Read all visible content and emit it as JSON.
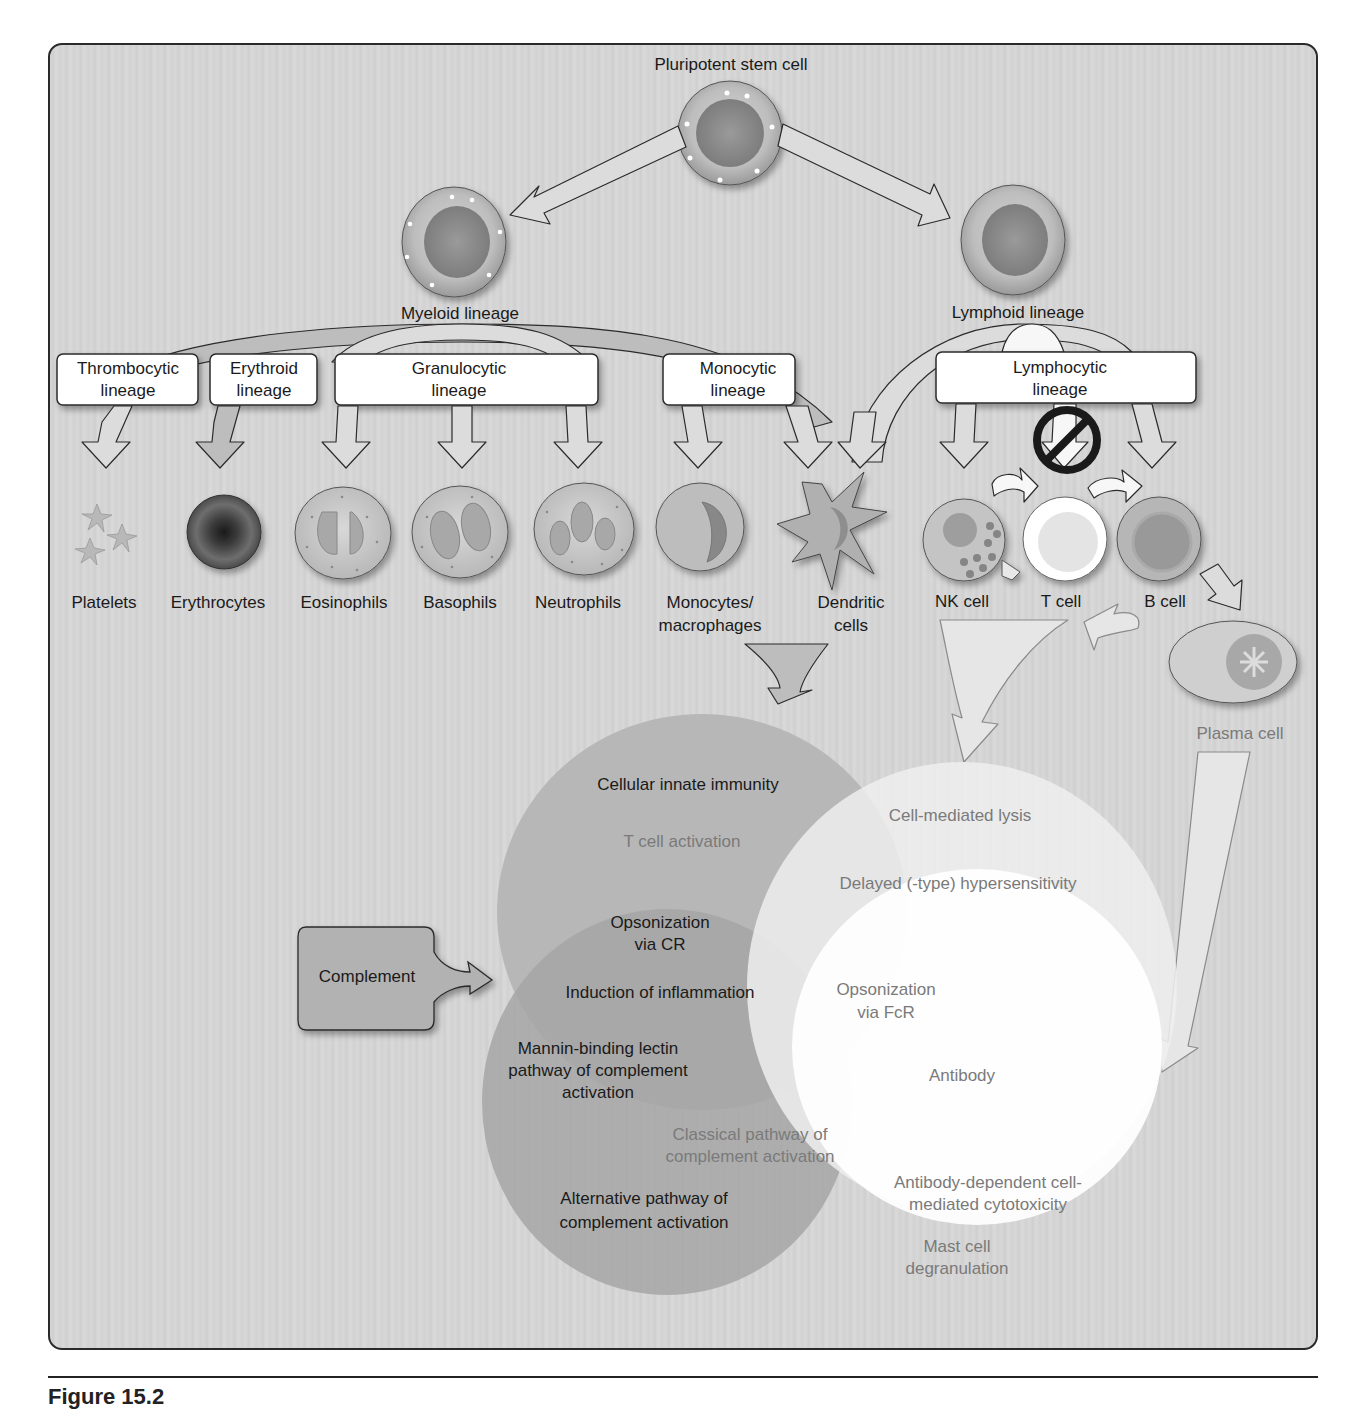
{
  "figure": {
    "caption": "Figure 15.2",
    "stem_cell": {
      "label": "Pluripotent stem cell"
    },
    "progenitors": [
      {
        "id": "myeloid",
        "label": "Myeloid lineage"
      },
      {
        "id": "lymphoid",
        "label": "Lymphoid lineage"
      }
    ],
    "lineage_boxes": [
      {
        "id": "thrombocytic",
        "line1": "Thrombocytic",
        "line2": "lineage"
      },
      {
        "id": "erythroid",
        "line1": "Erythroid",
        "line2": "lineage"
      },
      {
        "id": "granulocytic",
        "line1": "Granulocytic",
        "line2": "lineage"
      },
      {
        "id": "monocytic",
        "line1": "Monocytic",
        "line2": "lineage"
      },
      {
        "id": "lymphocytic",
        "line1": "Lymphocytic",
        "line2": "lineage"
      }
    ],
    "cells": [
      {
        "id": "platelets",
        "line1": "Platelets",
        "line2": ""
      },
      {
        "id": "erythrocytes",
        "line1": "Erythrocytes",
        "line2": ""
      },
      {
        "id": "eosinophils",
        "line1": "Eosinophils",
        "line2": ""
      },
      {
        "id": "basophils",
        "line1": "Basophils",
        "line2": ""
      },
      {
        "id": "neutrophils",
        "line1": "Neutrophils",
        "line2": ""
      },
      {
        "id": "monocytes",
        "line1": "Monocytes/",
        "line2": "macrophages"
      },
      {
        "id": "dendritic",
        "line1": "Dendritic",
        "line2": "cells"
      },
      {
        "id": "nk",
        "line1": "NK cell",
        "line2": ""
      },
      {
        "id": "t",
        "line1": "T cell",
        "line2": ""
      },
      {
        "id": "b",
        "line1": "B cell",
        "line2": ""
      },
      {
        "id": "plasma",
        "line1": "Plasma cell",
        "line2": ""
      }
    ],
    "complement_box": {
      "label": "Complement"
    },
    "venn_labels": {
      "cellular_innate_immunity": "Cellular innate immunity",
      "t_cell_activation": "T cell activation",
      "opsonization_cr_1": "Opsonization",
      "opsonization_cr_2": "via CR",
      "induction_inflammation": "Induction of inflammation",
      "mbl_1": "Mannin-binding lectin",
      "mbl_2": "pathway of complement",
      "mbl_3": "activation",
      "classical_1": "Classical pathway of",
      "classical_2": "complement activation",
      "alternative_1": "Alternative pathway of",
      "alternative_2": "complement activation",
      "cell_mediated_lysis": "Cell-mediated lysis",
      "delayed_hypersensitivity": "Delayed (-type) hypersensitivity",
      "opsonization_fcr_1": "Opsonization",
      "opsonization_fcr_2": "via FcR",
      "antibody": "Antibody",
      "adcc_1": "Antibody-dependent cell-",
      "adcc_2": "mediated cytotoxicity",
      "mast_1": "Mast cell",
      "mast_2": "degranulation"
    },
    "colors": {
      "frame_border": "#2a2a2a",
      "innate_circle": "#b4b4b4",
      "complement_circle": "#a6a6a6",
      "cellular_circle": "#ededed",
      "antibody_circle": "#ffffff",
      "label_dark": "#1a1a1a",
      "label_grey": "#7a7a7a"
    }
  }
}
